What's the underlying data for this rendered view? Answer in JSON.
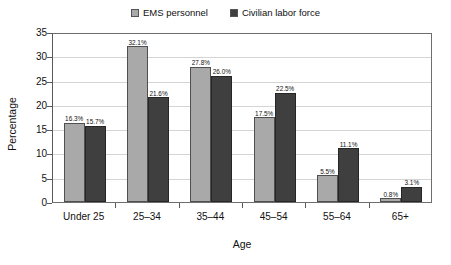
{
  "chart_data": {
    "type": "bar",
    "title": "",
    "xlabel": "Age",
    "ylabel": "Percentage",
    "ylim": [
      0,
      35
    ],
    "ytick_step": 5,
    "ytick_labels": [
      "0",
      "5",
      "10",
      "15",
      "20",
      "25",
      "30",
      "35"
    ],
    "grid": true,
    "legend_position": "top-center",
    "categories": [
      "Under 25",
      "25–34",
      "35–44",
      "45–54",
      "55–64",
      "65+"
    ],
    "series": [
      {
        "name": "EMS personnel",
        "color": "#a9a9a9",
        "values": [
          16.3,
          32.1,
          27.8,
          17.5,
          5.5,
          0.8
        ],
        "data_labels": [
          "16.3%",
          "32.1%",
          "27.8%",
          "17.5%",
          "5.5%",
          "0.8%"
        ]
      },
      {
        "name": "Civilian labor force",
        "color": "#3f3f3f",
        "values": [
          15.7,
          21.6,
          26.0,
          22.5,
          11.1,
          3.1
        ],
        "data_labels": [
          "15.7%",
          "21.6%",
          "26.0%",
          "22.5%",
          "11.1%",
          "3.1%"
        ]
      }
    ]
  },
  "legend": {
    "items": [
      {
        "label": "EMS personnel",
        "swatch_color": "#a9a9a9"
      },
      {
        "label": "Civilian labor force",
        "swatch_color": "#3f3f3f"
      }
    ]
  },
  "axes": {
    "y_title": "Percentage",
    "x_title": "Age",
    "y_ticks": [
      "35",
      "30",
      "25",
      "20",
      "15",
      "10",
      "5",
      "0"
    ]
  },
  "colors": {
    "series_ems": "#a9a9a9",
    "series_civilian": "#3f3f3f",
    "gridline": "#d4d4d4",
    "frame": "#6e6e6e",
    "text": "#111111",
    "background": "#ffffff"
  }
}
